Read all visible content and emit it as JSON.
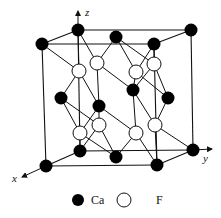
{
  "diagram": {
    "axes": {
      "x_label": "x",
      "y_label": "y",
      "z_label": "z"
    },
    "legend": [
      {
        "symbol": "filled-circle",
        "label": "Ca"
      },
      {
        "symbol": "open-circle",
        "label": "F"
      }
    ],
    "colors": {
      "ca_fill": "#000000",
      "f_fill": "#ffffff",
      "line": "#111111"
    },
    "ca_atoms": [
      {
        "id": "top-back-left",
        "x": 78,
        "y": 30
      },
      {
        "id": "top-back-right",
        "x": 191,
        "y": 30
      },
      {
        "id": "top-front-left",
        "x": 42,
        "y": 44
      },
      {
        "id": "top-front-right",
        "x": 154,
        "y": 44
      },
      {
        "id": "top-face-center",
        "x": 116,
        "y": 37
      },
      {
        "id": "bottom-back-left",
        "x": 80,
        "y": 151
      },
      {
        "id": "bottom-back-right",
        "x": 193,
        "y": 150
      },
      {
        "id": "bottom-front-left",
        "x": 46,
        "y": 166
      },
      {
        "id": "bottom-front-right",
        "x": 157,
        "y": 165
      },
      {
        "id": "bottom-face-center",
        "x": 116,
        "y": 157
      },
      {
        "id": "left-face-center",
        "x": 61,
        "y": 98
      },
      {
        "id": "right-face-center",
        "x": 168,
        "y": 98
      },
      {
        "id": "front-face-center",
        "x": 99,
        "y": 106
      },
      {
        "id": "back-face-center",
        "x": 133,
        "y": 90
      }
    ],
    "f_atoms": [
      {
        "x": 79,
        "y": 71
      },
      {
        "x": 97,
        "y": 63
      },
      {
        "x": 136,
        "y": 72
      },
      {
        "x": 154,
        "y": 64
      },
      {
        "x": 80,
        "y": 133
      },
      {
        "x": 99,
        "y": 125
      },
      {
        "x": 136,
        "y": 133
      },
      {
        "x": 155,
        "y": 125
      }
    ]
  }
}
